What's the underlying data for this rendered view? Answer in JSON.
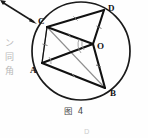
{
  "figure": {
    "caption": "图 4",
    "caption_number": "4",
    "type": "geometry-diagram",
    "shape": "circle-with-inscribed-quadrilateral",
    "point_labels": {
      "A": "A",
      "B": "B",
      "C": "C",
      "D": "D",
      "O": "O"
    },
    "points": [
      {
        "id": "A",
        "label": "A",
        "x": 42,
        "y": 63,
        "label_x": 31,
        "label_y": 71
      },
      {
        "id": "B",
        "label": "B",
        "x": 105,
        "y": 88,
        "label_x": 110,
        "label_y": 95
      },
      {
        "id": "C",
        "label": "C",
        "x": 47,
        "y": 27,
        "label_x": 39,
        "label_y": 22
      },
      {
        "id": "D",
        "label": "D",
        "x": 104,
        "y": 10,
        "label_x": 109,
        "label_y": 9
      },
      {
        "id": "O",
        "label": "O",
        "x": 93,
        "y": 44,
        "label_x": 97,
        "label_y": 48
      }
    ],
    "circle": {
      "cx": 81,
      "cy": 51,
      "r": 49
    },
    "segments": [
      {
        "from": "C",
        "to": "D",
        "weight": "bold",
        "tick": 1
      },
      {
        "from": "D",
        "to": "O",
        "weight": "bold",
        "tick": 1
      },
      {
        "from": "C",
        "to": "O",
        "weight": "bold",
        "tick": 1
      },
      {
        "from": "C",
        "to": "A",
        "weight": "light",
        "tick": 1
      },
      {
        "from": "A",
        "to": "O",
        "weight": "bold",
        "tick": 0
      },
      {
        "from": "A",
        "to": "B",
        "weight": "bold",
        "tick": 1
      },
      {
        "from": "O",
        "to": "B",
        "weight": "bold",
        "tick": 1
      },
      {
        "from": "C",
        "to": "B",
        "weight": "light",
        "tick": 0
      }
    ],
    "annotation_arrow": {
      "from_x": 2,
      "from_y": 2,
      "to_x": 37,
      "to_y": 24
    }
  },
  "margin_notes": {
    "characters": [
      "ン",
      "同",
      "角"
    ]
  },
  "footer": {
    "fragment": "D"
  },
  "colors": {
    "ink": "#111111",
    "light_ink": "#8c8c8c",
    "paper": "#fefefe",
    "faint": "#c8c8c8"
  }
}
